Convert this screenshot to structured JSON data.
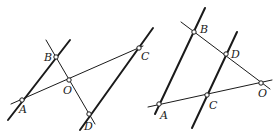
{
  "figures": [
    {
      "id": "left",
      "points": {
        "A": {
          "label": "A",
          "x": 22,
          "y": 100,
          "lx": 19,
          "ly": 113
        },
        "B": {
          "label": "B",
          "x": 56,
          "y": 57,
          "lx": 44,
          "ly": 61
        },
        "O": {
          "label": "O",
          "x": 69,
          "y": 80,
          "lx": 63,
          "ly": 94
        },
        "C": {
          "label": "C",
          "x": 139,
          "y": 48,
          "lx": 141,
          "ly": 60
        },
        "D": {
          "label": "D",
          "x": 89,
          "y": 114,
          "lx": 84,
          "ly": 130
        }
      },
      "lines": [
        {
          "name": "line-AB",
          "style": "thick",
          "x1": 8,
          "y1": 120,
          "x2": 70,
          "y2": 40
        },
        {
          "name": "line-BD",
          "style": "thin",
          "x1": 46,
          "y1": 40,
          "x2": 95,
          "y2": 124
        },
        {
          "name": "line-AC",
          "style": "thin",
          "x1": 11,
          "y1": 104,
          "x2": 143,
          "y2": 46
        },
        {
          "name": "line-DC",
          "style": "thick",
          "x1": 80,
          "y1": 130,
          "x2": 153,
          "y2": 28
        }
      ]
    },
    {
      "id": "right",
      "points": {
        "A": {
          "label": "A",
          "x": 159,
          "y": 104,
          "lx": 160,
          "ly": 119
        },
        "B": {
          "label": "B",
          "x": 194,
          "y": 32,
          "lx": 200,
          "ly": 33
        },
        "C": {
          "label": "C",
          "x": 207,
          "y": 95,
          "lx": 209,
          "ly": 109
        },
        "D": {
          "label": "D",
          "x": 226,
          "y": 54,
          "lx": 231,
          "ly": 58
        },
        "O": {
          "label": "O",
          "x": 261,
          "y": 83,
          "lx": 258,
          "ly": 97
        }
      },
      "lines": [
        {
          "name": "line-AB",
          "style": "thick",
          "x1": 155,
          "y1": 114,
          "x2": 205,
          "y2": 8
        },
        {
          "name": "line-BO",
          "style": "thin",
          "x1": 181,
          "y1": 22,
          "x2": 270,
          "y2": 89
        },
        {
          "name": "line-AO",
          "style": "thin",
          "x1": 148,
          "y1": 107,
          "x2": 272,
          "y2": 80
        },
        {
          "name": "line-CD",
          "style": "thick",
          "x1": 192,
          "y1": 128,
          "x2": 237,
          "y2": 32
        }
      ]
    }
  ]
}
